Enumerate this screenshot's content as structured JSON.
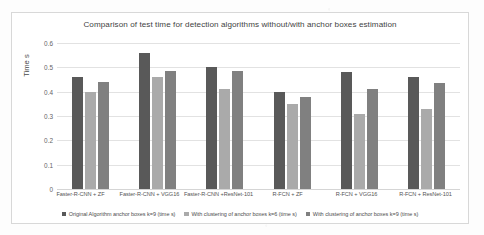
{
  "chart_data": {
    "type": "bar",
    "title": "Comparison of test time for detection algorithms without/with anchor boxes estimation",
    "xlabel": "",
    "ylabel": "Time s",
    "ylim": [
      0,
      0.6
    ],
    "yticks": [
      "0",
      "0.1",
      "0.2",
      "0.3",
      "0.4",
      "0.5",
      "0.6"
    ],
    "grid": true,
    "legend_position": "bottom",
    "categories": [
      "Faster-R-CNN + ZF",
      "Faster-R-CNN + VGG16",
      "Faster-R-CNN +ResNet-101",
      "R-FCN + ZF",
      "R-FCN + VGG16",
      "R-FCN + ResNet-101"
    ],
    "series": [
      {
        "name": "Original Algorithm anchor boxes k=9 (time s)",
        "color": "#595959",
        "values": [
          0.46,
          0.56,
          0.5,
          0.4,
          0.48,
          0.46
        ]
      },
      {
        "name": "With clustering of anchor boxes k=6 (time s)",
        "color": "#aaaaaa",
        "values": [
          0.4,
          0.46,
          0.41,
          0.35,
          0.31,
          0.33
        ]
      },
      {
        "name": "With clustering of anchor boxes k=9 (time s)",
        "color": "#808080",
        "values": [
          0.44,
          0.485,
          0.485,
          0.38,
          0.41,
          0.435
        ]
      }
    ]
  }
}
